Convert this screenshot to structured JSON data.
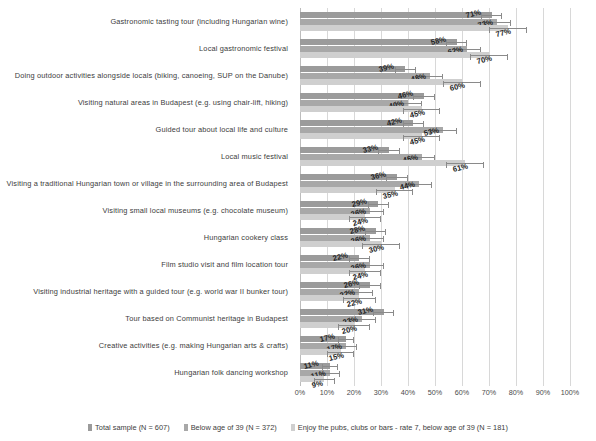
{
  "chart_data": {
    "type": "bar",
    "orientation": "horizontal",
    "title": "",
    "xlabel": "",
    "ylabel": "",
    "xlim": [
      0,
      100
    ],
    "xticks": [
      "0%",
      "10%",
      "20%",
      "30%",
      "40%",
      "50%",
      "60%",
      "70%",
      "80%",
      "90%",
      "100%"
    ],
    "grid": true,
    "legend_position": "bottom",
    "error_bars": true,
    "categories": [
      "Gastronomic tasting tour (including Hungarian wine)",
      "Local gastronomic festival",
      "Doing outdoor activities alongside locals (biking, canoeing, SUP on the Danube)",
      "Visiting natural areas in Budapest (e.g. using chair-lift, hiking)",
      "Guided tour about local life and culture",
      "Local music festival",
      "Visiting a traditional Hungarian town or village in the surrounding area of Budapest",
      "Visiting small local museums (e.g. chocolate museum)",
      "Hungarian cookery class",
      "Film studio visit and film location tour",
      "Visiting industrial heritage with a guided tour (e.g. world war II bunker tour)",
      "Tour based on Communist heritage in Budapest",
      "Creative activities (e.g. making Hungarian arts & crafts)",
      "Hungarian folk dancing workshop"
    ],
    "series": [
      {
        "name": "Total sample (N = 607)",
        "color": "#9b9b9b",
        "values": [
          71,
          58,
          39,
          46,
          42,
          33,
          36,
          29,
          28,
          22,
          26,
          31,
          17,
          11
        ],
        "labels": [
          "71%",
          "58%",
          "39%",
          "46%",
          "42%",
          "33%",
          "36%",
          "29%",
          "28%",
          "22%",
          "26%",
          "31%",
          "17%",
          "11%"
        ],
        "err_low": [
          67,
          54,
          35,
          42,
          38,
          29,
          32,
          25,
          24,
          18,
          22,
          27,
          14,
          8
        ],
        "err_high": [
          75,
          62,
          43,
          50,
          46,
          37,
          40,
          33,
          32,
          26,
          30,
          35,
          20,
          14
        ]
      },
      {
        "name": "Below age of 39 (N = 372)",
        "color": "#a8a8a8",
        "values": [
          73,
          62,
          48,
          40,
          53,
          45,
          44,
          26,
          26,
          26,
          22,
          23,
          17,
          11
        ],
        "labels": [
          "73%",
          "62%",
          "48%",
          "40%",
          "53%",
          "45%",
          "44%",
          "26%",
          "26%",
          "26%",
          "22%",
          "23%",
          "17%",
          "11%"
        ],
        "err_low": [
          68,
          57,
          43,
          35,
          48,
          40,
          39,
          21,
          21,
          21,
          17,
          18,
          13,
          7
        ],
        "err_high": [
          78,
          67,
          53,
          45,
          58,
          50,
          49,
          31,
          31,
          31,
          27,
          28,
          21,
          15
        ]
      },
      {
        "name": "Enjoy the pubs, clubs or bars - rate 7, below age of 39 (N = 181)",
        "color": "#cfcfcf",
        "values": [
          77,
          70,
          60,
          45,
          45,
          61,
          35,
          24,
          30,
          24,
          22,
          20,
          15,
          9
        ],
        "labels": [
          "77%",
          "70%",
          "60%",
          "45%",
          "45%",
          "61%",
          "35%",
          "24%",
          "30%",
          "24%",
          "22%",
          "20%",
          "15%",
          "9%"
        ],
        "err_low": [
          70,
          63,
          53,
          38,
          38,
          54,
          28,
          18,
          23,
          18,
          16,
          14,
          10,
          5
        ],
        "err_high": [
          84,
          77,
          67,
          52,
          52,
          68,
          42,
          30,
          37,
          30,
          28,
          26,
          20,
          13
        ]
      }
    ]
  },
  "legend": {
    "items": [
      {
        "label": "Total sample (N = 607)"
      },
      {
        "label": "Below age of 39 (N = 372)"
      },
      {
        "label": "Enjoy the pubs, clubs or bars - rate 7, below age of 39 (N = 181)"
      }
    ]
  }
}
